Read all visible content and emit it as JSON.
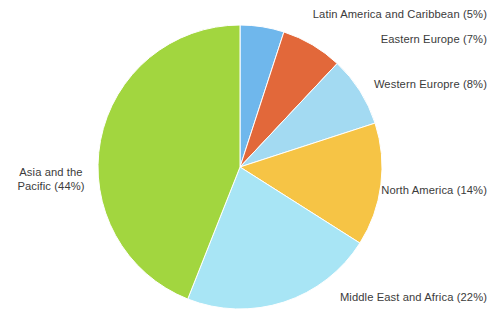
{
  "chart_data": {
    "type": "pie",
    "title": "",
    "subtitle": "",
    "xlabel": "",
    "ylabel": "",
    "legend_position": "none",
    "grid": false,
    "units": "percent",
    "total": 100,
    "start_angle_deg": 0,
    "direction": "clockwise",
    "categories": [
      "Latin America and Caribbean",
      "Eastern Europe",
      "Western Europre",
      "North America",
      "Middle East and Africa",
      "Asia and the Pacific"
    ],
    "values": [
      5,
      7,
      8,
      14,
      22,
      44
    ],
    "colors": [
      "#6fb7ec",
      "#e2683a",
      "#a3daf2",
      "#f6c445",
      "#a8e5f5",
      "#a2d63f"
    ],
    "slices": [
      {
        "name": "Latin America and Caribbean",
        "value": 5,
        "label": "Latin America and Caribbean (5%)",
        "color": "#6fb7ec"
      },
      {
        "name": "Eastern Europe",
        "value": 7,
        "label": "Eastern Europe (7%)",
        "color": "#e2683a"
      },
      {
        "name": "Western Europre",
        "value": 8,
        "label": "Western Europre (8%)",
        "color": "#a3daf2"
      },
      {
        "name": "North America",
        "value": 14,
        "label": "North America (14%)",
        "color": "#f6c445"
      },
      {
        "name": "Middle East and Africa",
        "value": 22,
        "label": "Middle East and Africa (22%)",
        "color": "#a8e5f5"
      },
      {
        "name": "Asia and the Pacific",
        "value": 44,
        "label_line1": "Asia and the",
        "label_line2": "Pacific (44%)",
        "label": "Asia and the Pacific (44%)",
        "color": "#a2d63f"
      }
    ]
  },
  "figure": {
    "background": "#ffffff",
    "text_color": "#3b3b3b",
    "center_x": 240,
    "center_y": 167,
    "radius": 142
  }
}
